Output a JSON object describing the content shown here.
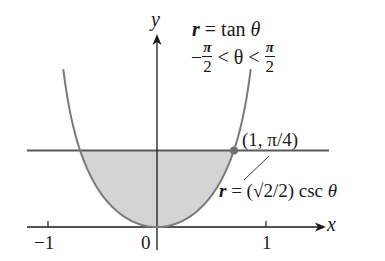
{
  "figure": {
    "axes": {
      "x_label": "x",
      "y_label": "y",
      "x_ticks": [
        {
          "value": -1,
          "label": "−1"
        },
        {
          "value": 0,
          "label": "0"
        },
        {
          "value": 1,
          "label": "1"
        }
      ],
      "origin_px": [
        157,
        227
      ],
      "unit_px": 109
    },
    "curves": [
      {
        "name": "r = tan θ",
        "equation": "r = tan θ",
        "domain": "−π/2 < θ < π/2",
        "color": "#7a7a7a"
      },
      {
        "name": "r = (√2/2) csc θ",
        "equation": "r = (√2/2) csc θ",
        "color": "#5a5a5a"
      }
    ],
    "labels": {
      "curve1_eq_r": "r",
      "curve1_eq_rest": " = tan ",
      "curve1_eq_theta": "θ",
      "domain_minus": "−",
      "domain_pi": "π",
      "domain_two": "2",
      "domain_mid": " < θ < ",
      "intersection": "(1, π/4)",
      "curve2_r": "r",
      "curve2_rest": " = (√2/2) csc ",
      "curve2_theta": "θ"
    },
    "intersection_point": {
      "polar": "(1, π/4)",
      "x": 0.7071,
      "y": 0.7071
    },
    "shaded_region": {
      "description": "region inside r = tan θ below r = (√2/2) csc θ",
      "fill": "#d4d4d4"
    },
    "colors": {
      "axis": "#1a1a1a",
      "curve": "#7a7a7a",
      "line": "#5a5a5a",
      "shade": "#d4d4d4",
      "point": "#707070"
    }
  }
}
